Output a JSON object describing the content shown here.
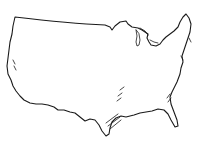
{
  "map": {
    "subject": "outline of the contiguous United States",
    "style": "hand-drawn black line art on white",
    "stroke_color": "#1a1a1a",
    "background_color": "#ffffff",
    "labels": []
  }
}
